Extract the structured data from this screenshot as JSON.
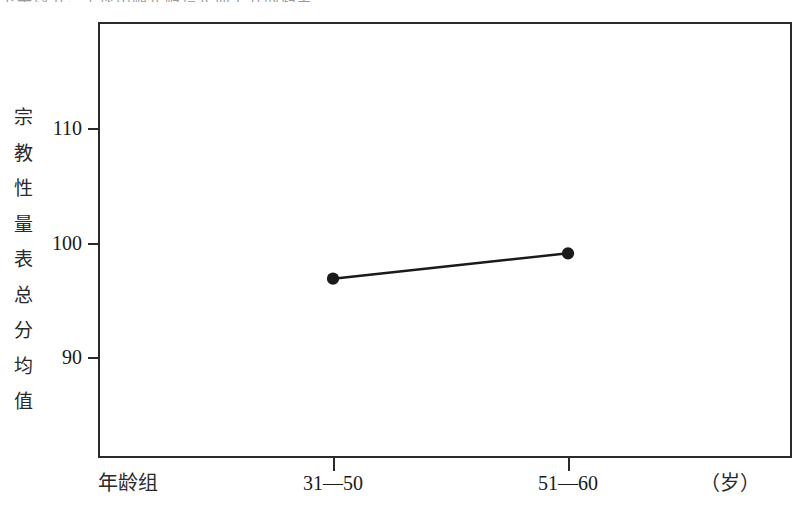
{
  "figure": {
    "top_clipped_text": "下平均分，呈现出随年龄增长而上升的趋势。",
    "background_color": "#ffffff",
    "line_color": "#2a2a2a",
    "marker_color": "#1a1a1a"
  },
  "axes": {
    "y_title_chars": [
      "宗",
      "教",
      "性",
      "量",
      "表",
      "总",
      "分",
      "均",
      "值"
    ],
    "y_title": "宗教性量表总分均值",
    "x_title": "年龄组",
    "x_unit": "（岁）",
    "y_ticks": [
      {
        "label": "110",
        "value": 110
      },
      {
        "label": "100",
        "value": 100
      },
      {
        "label": "90",
        "value": 90
      }
    ],
    "x_ticks": [
      {
        "label": "31—50"
      },
      {
        "label": "51—60"
      }
    ]
  },
  "chart_data": {
    "type": "line",
    "title": "",
    "xlabel": "年龄组",
    "ylabel": "宗教性量表总分均值",
    "categories": [
      "31—50",
      "51—60"
    ],
    "values": [
      96.9,
      99.1
    ],
    "series": [
      {
        "name": "宗教性量表总分均值",
        "values": [
          96.9,
          99.1
        ]
      }
    ],
    "ylim": [
      86.2,
      124.1
    ],
    "yticks": [
      90,
      100,
      110
    ],
    "xticklabels": [
      "31—50",
      "51—60"
    ],
    "x_unit": "（岁）",
    "grid": false,
    "legend": "none",
    "marker": "filled-circle",
    "marker_size": 11,
    "line_width": 2.5,
    "color": "#1a1a1a"
  }
}
